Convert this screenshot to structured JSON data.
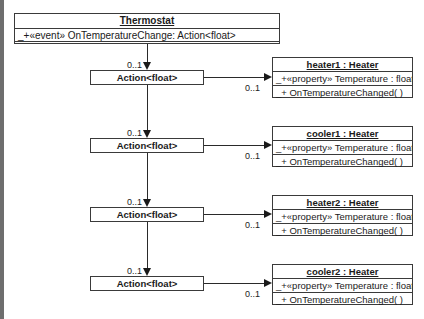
{
  "thermostat": {
    "name": "Thermostat",
    "event": "_+«event» OnTemperatureChange: Action<float>"
  },
  "delegates": [
    {
      "label": "Action<float>",
      "incoming_multiplicity": "0..1",
      "outgoing_multiplicity": "0..1"
    },
    {
      "label": "Action<float>",
      "incoming_multiplicity": "0..1",
      "outgoing_multiplicity": "0..1"
    },
    {
      "label": "Action<float>",
      "incoming_multiplicity": "0..1",
      "outgoing_multiplicity": "0..1"
    },
    {
      "label": "Action<float>",
      "incoming_multiplicity": "0..1",
      "outgoing_multiplicity": "0..1"
    }
  ],
  "instances": [
    {
      "name": "heater1 : Heater",
      "attribute": "_+«property» Temperature : float",
      "method": "_+ OnTemperatureChanged( )"
    },
    {
      "name": "cooler1 : Heater",
      "attribute": "_+«property» Temperature : float",
      "method": "_+ OnTemperatureChanged( )"
    },
    {
      "name": "heater2 : Heater",
      "attribute": "_+«property» Temperature : float",
      "method": "_+ OnTemperatureChanged( )"
    },
    {
      "name": "cooler2 : Heater",
      "attribute": "_+«property» Temperature : float",
      "method": "_+ OnTemperatureChanged( )"
    }
  ],
  "colors": {
    "line": "#2a2a2a",
    "border": "#3a3a3a",
    "background": "#ffffff",
    "left_edge": "#6e6e6e"
  }
}
